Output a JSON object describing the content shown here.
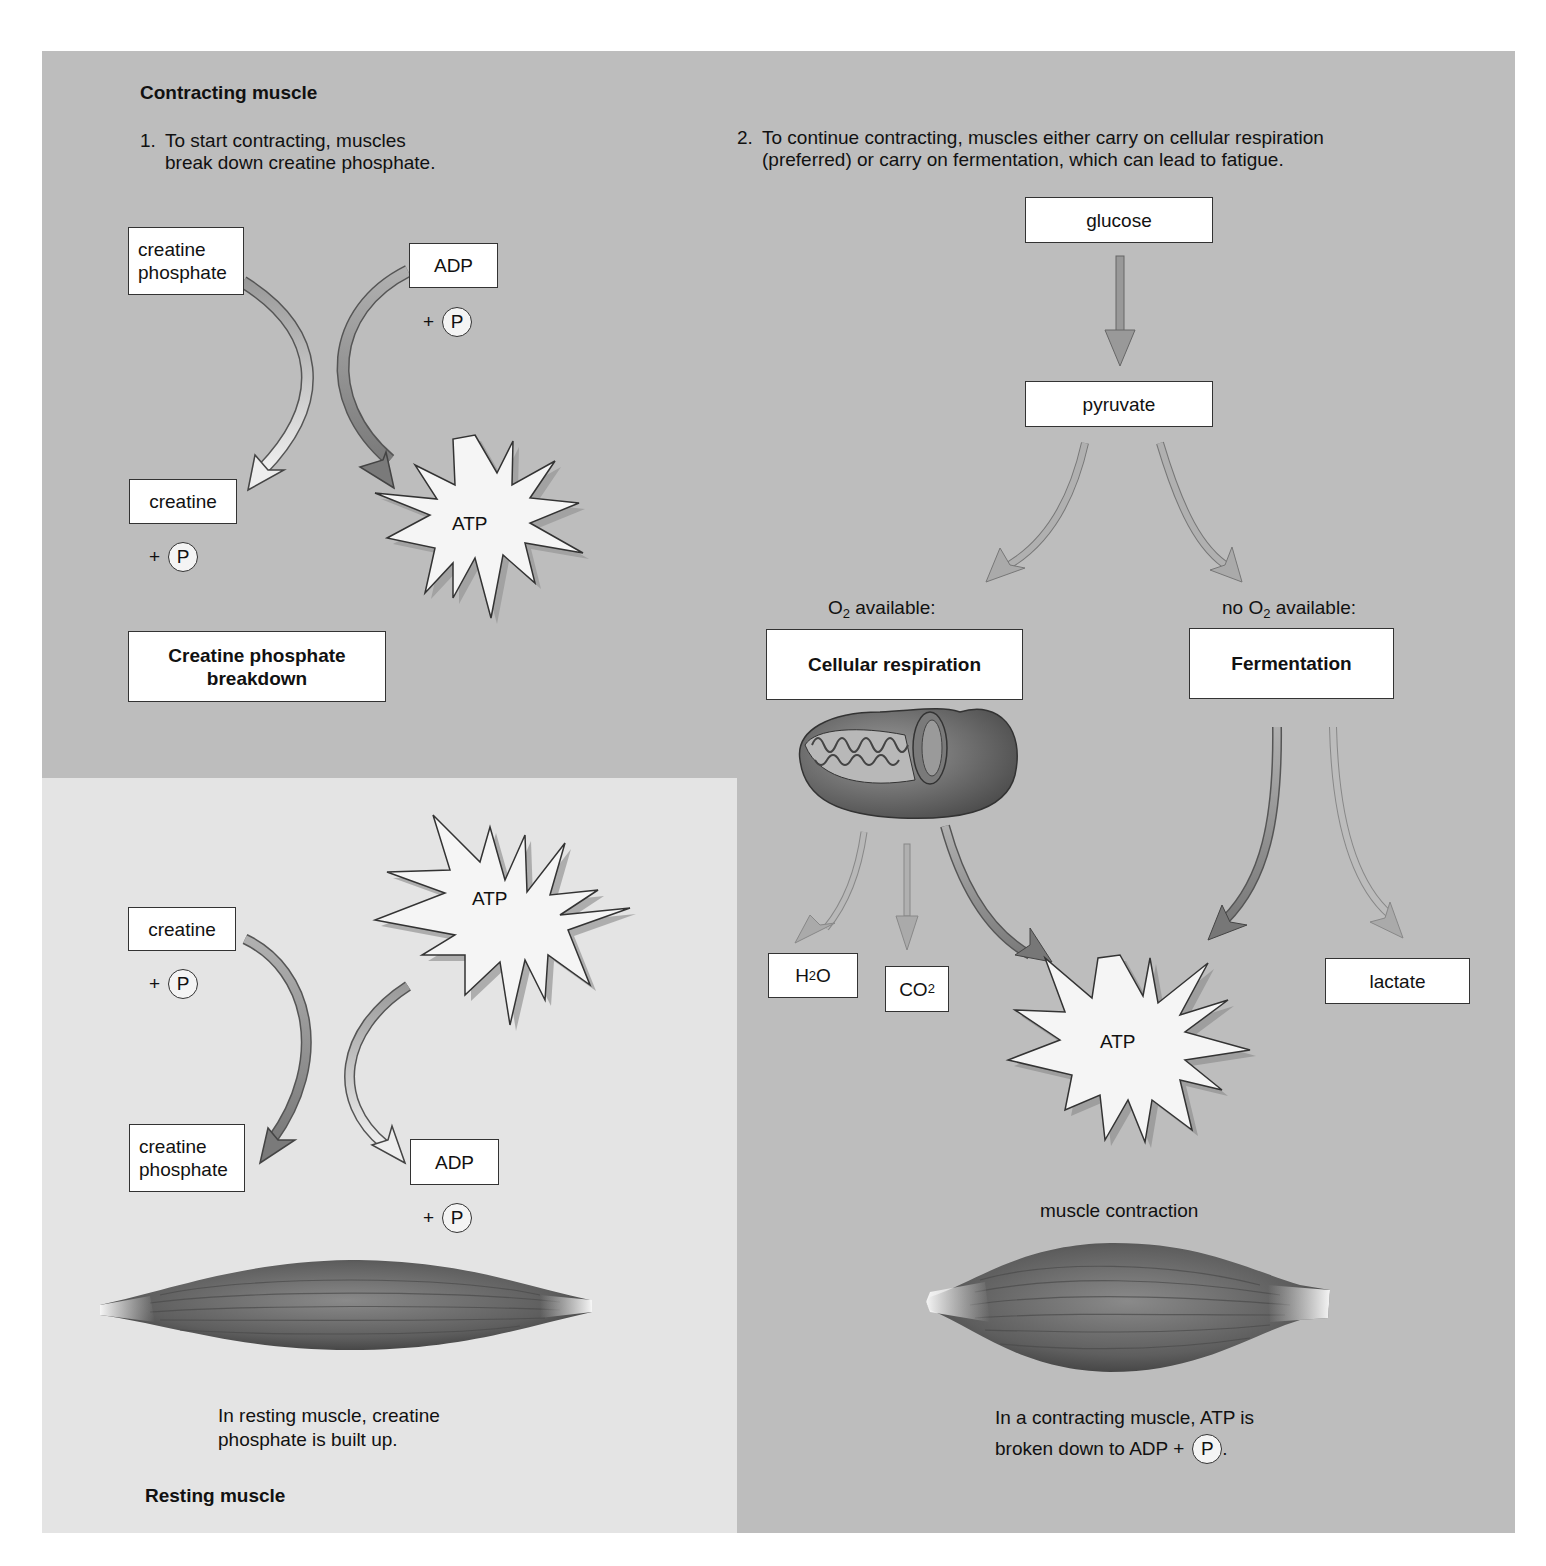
{
  "figure": {
    "contracting": {
      "title": "Contracting muscle",
      "step1": {
        "num": "1.",
        "line1": "To start contracting, muscles",
        "line2": "break down creatine phosphate."
      },
      "step2": {
        "num": "2.",
        "line1": "To continue contracting, muscles either carry on cellular respiration",
        "line2": "(preferred) or carry on fermentation, which can lead to fatigue."
      },
      "breakdown": {
        "creatine_phosphate": [
          "creatine",
          "phosphate"
        ],
        "adp": "ADP",
        "creatine": "creatine",
        "atp": "ATP",
        "plus": "+",
        "p": "P",
        "label_line1": "Creatine phosphate",
        "label_line2": "breakdown"
      },
      "pathway": {
        "glucose": "glucose",
        "pyruvate": "pyruvate",
        "o2_available_prefix": "O",
        "o2_sub": "2",
        "o2_available_suffix": " available:",
        "no_o2_prefix": "no O",
        "no_o2_suffix": " available:",
        "cellular_respiration": "Cellular respiration",
        "fermentation": "Fermentation",
        "h2o_h": "H",
        "h2o_sub": "2",
        "h2o_o": "O",
        "co2_co": "CO",
        "co2_sub": "2",
        "lactate": "lactate",
        "atp": "ATP",
        "muscle_contraction": "muscle contraction",
        "caption_line1": "In a contracting muscle, ATP is",
        "caption_line2_prefix": "broken down to ADP +",
        "caption_p": "P",
        "caption_end": "."
      }
    },
    "resting": {
      "title": "Resting muscle",
      "creatine": "creatine",
      "creatine_phosphate": [
        "creatine",
        "phosphate"
      ],
      "atp": "ATP",
      "adp": "ADP",
      "plus": "+",
      "p": "P",
      "caption_line1": "In resting muscle, creatine",
      "caption_line2": "phosphate is built up."
    },
    "colors": {
      "panel_gray": "#bdbdbd",
      "resting_panel": "#e4e4e4",
      "arrow_dark": "#8a8a8a",
      "arrow_light": "#d8d8d8",
      "muscle_dark": "#5a5a5a",
      "box_fill": "#ffffff"
    }
  }
}
